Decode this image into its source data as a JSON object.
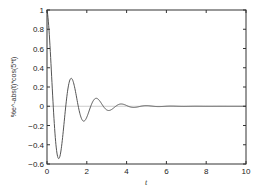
{
  "chart_data": {
    "type": "line",
    "title": "",
    "xlabel": "t",
    "ylabel": "%e^-abs(t)*cos(5*t)",
    "xlim": [
      0,
      10
    ],
    "ylim": [
      -0.6,
      1
    ],
    "xticks": [
      "0",
      "2",
      "4",
      "6",
      "8",
      "10"
    ],
    "yticks": [
      "-0.6",
      "-0.4",
      "-0.2",
      "0",
      "0.2",
      "0.4",
      "0.6",
      "0.8",
      "1"
    ],
    "grid": false,
    "legend": null,
    "zero_line": true,
    "series": [
      {
        "name": "%e^-abs(t)*cos(5*t)",
        "function": "exp(-abs(t))*cos(5*t)",
        "x": [
          0,
          0.2,
          0.4,
          0.6,
          0.8,
          1.0,
          1.2,
          1.4,
          1.6,
          1.8,
          2.0,
          2.2,
          2.4,
          2.6,
          2.8,
          3.0,
          3.5,
          4.0,
          5.0,
          6.0,
          8.0,
          10.0
        ],
        "values": [
          1.0,
          0.442,
          -0.279,
          -0.544,
          -0.294,
          0.104,
          0.289,
          0.187,
          -0.029,
          -0.149,
          -0.114,
          -0.001,
          0.077,
          0.063,
          0.01,
          -0.038,
          -0.006,
          0.007,
          0.007,
          0.0,
          0.0,
          0.0
        ]
      }
    ],
    "colors": {
      "line": "#555555",
      "axes": "#333333",
      "zero_line": "#bbbbbb"
    }
  }
}
